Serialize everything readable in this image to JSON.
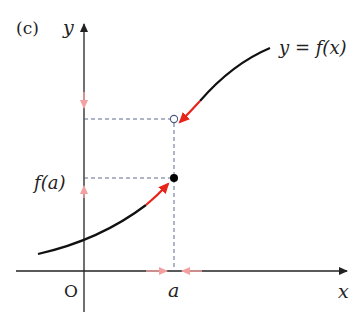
{
  "panel_label": "(c)",
  "axes": {
    "x_label": "x",
    "y_label": "y",
    "origin_label": "O"
  },
  "curve_label": "y = f(x)",
  "point_labels": {
    "a_tick": "a",
    "f_of_a": "f(a)"
  },
  "colors": {
    "axis": "#222222",
    "curve": "#111111",
    "approach_arrow": "#e8231a",
    "limit_arrow": "#f2a0a0",
    "dashed": "#4a5a80"
  },
  "description": {
    "type": "jump discontinuity at x = a",
    "filled_point": "(a, f(a))",
    "open_point": "upper limit from right"
  }
}
